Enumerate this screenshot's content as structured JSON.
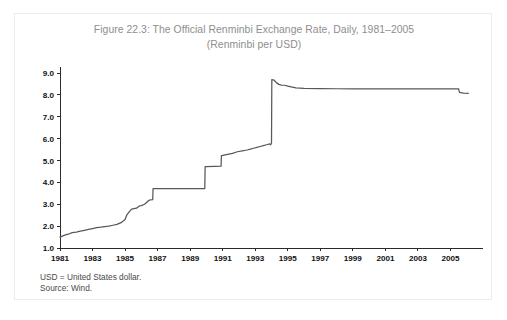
{
  "figure": {
    "title_line1": "Figure 22.3: The Official Renminbi Exchange Rate, Daily, 1981–2005",
    "title_line2": "(Renminbi per USD)",
    "note_line1": "USD = United States dollar.",
    "note_line2": "Source: Wind."
  },
  "chart_data": {
    "type": "line",
    "title": "Figure 22.3: The Official Renminbi Exchange Rate, Daily, 1981–2005 (Renminbi per USD)",
    "subtitle": "(Renminbi per USD)",
    "xlabel": "",
    "ylabel": "",
    "xlim": [
      1981,
      2006.2
    ],
    "ylim": [
      1.0,
      9.0
    ],
    "yticks": [
      "1.0",
      "2.0",
      "3.0",
      "4.0",
      "5.0",
      "6.0",
      "7.0",
      "8.0",
      "9.0"
    ],
    "ytick_values": [
      1.0,
      2.0,
      3.0,
      4.0,
      5.0,
      6.0,
      7.0,
      8.0,
      9.0
    ],
    "xticks": [
      "1981",
      "1983",
      "1985",
      "1987",
      "1989",
      "1991",
      "1993",
      "1995",
      "1997",
      "1999",
      "2001",
      "2003",
      "2005"
    ],
    "xtick_values": [
      1981,
      1983,
      1985,
      1987,
      1989,
      1991,
      1993,
      1995,
      1997,
      1999,
      2001,
      2003,
      2005
    ],
    "grid": false,
    "legend": "none",
    "line_color": "#58585a",
    "axis_color": "#2b2b2b",
    "title_color": "#8e8e8e",
    "series": [
      {
        "name": "Official Renminbi Exchange Rate (RMB per USD)",
        "x": [
          1981.0,
          1981.25,
          1981.5,
          1981.75,
          1982.0,
          1982.25,
          1982.5,
          1982.75,
          1983.0,
          1983.25,
          1983.5,
          1983.75,
          1984.0,
          1984.25,
          1984.5,
          1984.75,
          1985.0,
          1985.1,
          1985.25,
          1985.4,
          1985.55,
          1985.7,
          1985.9,
          1986.0,
          1986.2,
          1986.45,
          1986.55,
          1986.7,
          1986.72,
          1987.0,
          1988.0,
          1989.0,
          1989.9,
          1989.92,
          1990.0,
          1990.5,
          1990.9,
          1990.92,
          1991.0,
          1991.3,
          1991.6,
          1991.9,
          1992.2,
          1992.5,
          1992.7,
          1992.9,
          1993.1,
          1993.3,
          1993.5,
          1993.7,
          1993.9,
          1993.95,
          1993.99,
          1994.0,
          1994.02,
          1994.15,
          1994.3,
          1994.45,
          1994.6,
          1994.8,
          1995.0,
          1995.5,
          1996.0,
          1997.0,
          1998.0,
          1999.0,
          2000.0,
          2001.0,
          2002.0,
          2003.0,
          2004.0,
          2005.0,
          2005.5,
          2005.55,
          2005.8,
          2006.1
        ],
        "y": [
          1.5,
          1.58,
          1.63,
          1.7,
          1.73,
          1.77,
          1.81,
          1.85,
          1.89,
          1.93,
          1.95,
          1.98,
          2.0,
          2.04,
          2.08,
          2.16,
          2.3,
          2.5,
          2.65,
          2.78,
          2.8,
          2.82,
          2.93,
          2.94,
          3.0,
          3.17,
          3.2,
          3.21,
          3.72,
          3.72,
          3.72,
          3.72,
          3.72,
          4.72,
          4.72,
          4.73,
          4.74,
          5.22,
          5.23,
          5.28,
          5.33,
          5.4,
          5.44,
          5.48,
          5.52,
          5.56,
          5.6,
          5.64,
          5.68,
          5.72,
          5.76,
          5.72,
          5.78,
          5.8,
          8.7,
          8.68,
          8.56,
          8.48,
          8.45,
          8.44,
          8.4,
          8.32,
          8.3,
          8.29,
          8.28,
          8.28,
          8.28,
          8.28,
          8.28,
          8.28,
          8.28,
          8.28,
          8.28,
          8.11,
          8.08,
          8.07
        ],
        "description": "Daily official RMB/USD rate: gradual depreciation from ~1.5 in 1981, stepwise devaluations through 1985-1986 to a 3.72 plateau, step to 4.72 in late 1989, gradual rise to ~5.8 by end-1993, the January 1994 unification devaluation spiking to ~8.7, settling near 8.28 and held flat until the July 2005 revaluation down to ~8.1."
      }
    ],
    "annotations": [
      {
        "label": "1994 exchange rate unification / devaluation",
        "x": 1994.0,
        "y_from": 5.8,
        "y_to": 8.7
      },
      {
        "label": "July 2005 revaluation",
        "x": 2005.5,
        "y_from": 8.28,
        "y_to": 8.11
      }
    ]
  }
}
